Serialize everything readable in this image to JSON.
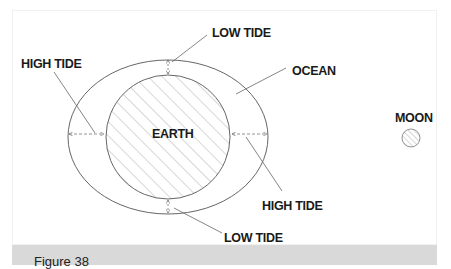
{
  "figure": {
    "caption": "Figure 38",
    "labels": {
      "low_tide_top": "LOW TIDE",
      "high_tide_left": "HIGH TIDE",
      "ocean": "OCEAN",
      "earth": "EARTH",
      "moon": "MOON",
      "high_tide_right": "HIGH TIDE",
      "low_tide_bottom": "LOW TIDE"
    },
    "colors": {
      "line": "#555555",
      "hatch": "#9a9a9a",
      "caption_bar": "#d9d9d9",
      "text": "#1a1a1a"
    }
  }
}
